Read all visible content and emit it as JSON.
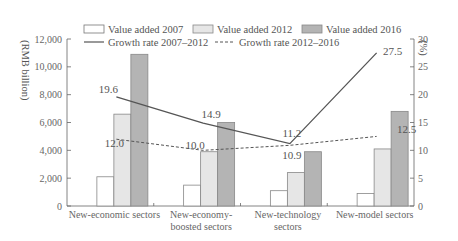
{
  "chart_data": {
    "type": "bar",
    "title": "",
    "categories": [
      "New-economic sectors",
      "New-economy-boosted sectors",
      "New-technology sectors",
      "New-model sectors"
    ],
    "category_lines": [
      [
        "New-economic sectors"
      ],
      [
        "New-economy-",
        "boosted sectors"
      ],
      [
        "New-technology",
        "sectors"
      ],
      [
        "New-model sectors"
      ]
    ],
    "series": [
      {
        "name": "Value added 2007",
        "kind": "bar",
        "axis": "left",
        "values": [
          2100,
          1500,
          1100,
          900
        ],
        "color": "#ffffff"
      },
      {
        "name": "Value added 2012",
        "kind": "bar",
        "axis": "left",
        "values": [
          6600,
          3900,
          2400,
          4100
        ],
        "color": "#e6e6e6"
      },
      {
        "name": "Value added 2016",
        "kind": "bar",
        "axis": "left",
        "values": [
          10900,
          6000,
          3900,
          6800
        ],
        "color": "#b4b4b4"
      },
      {
        "name": "Growth rate 2007–2012",
        "kind": "line",
        "style": "solid",
        "axis": "right",
        "values": [
          19.6,
          14.9,
          11.2,
          27.5
        ],
        "color": "#555555"
      },
      {
        "name": "Growth rate 2012–2016",
        "kind": "line",
        "style": "dashed",
        "axis": "right",
        "values": [
          12.0,
          10.0,
          10.9,
          12.5
        ],
        "color": "#555555"
      }
    ],
    "ylabel": "(RMB billion)",
    "y2label": "(%)",
    "ylim": [
      0,
      12000
    ],
    "y2lim": [
      0,
      30
    ],
    "yticks": [
      "0",
      "2,000",
      "4,000",
      "6,000",
      "8,000",
      "10,000",
      "12,000"
    ],
    "y2ticks": [
      "0",
      "5",
      "10",
      "15",
      "20",
      "25",
      "30"
    ],
    "grid": false,
    "legend_position": "top",
    "data_labels": {
      "growth_2007_2012": [
        "19.6",
        "14.9",
        "11.2",
        "27.5"
      ],
      "growth_2012_2016": [
        "12.0",
        "10.0",
        "10.9",
        "12.5"
      ]
    }
  },
  "legend": {
    "item1": "Value added 2007",
    "item2": "Value added 2012",
    "item3": "Value added 2016",
    "item4": "Growth rate 2007–2012",
    "item5": "Growth rate 2012–2016"
  },
  "axes": {
    "left_title": "(RMB billion)",
    "right_title": "(%)"
  }
}
